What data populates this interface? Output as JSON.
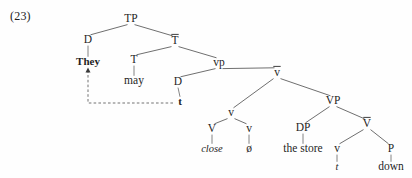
{
  "figure": {
    "example_number": "(23)",
    "caption": "",
    "background_color": "#fefefe",
    "line_color": "#555555",
    "text_color": "#1f1f1f"
  },
  "chart_data": {
    "type": "diagram",
    "subtype": "syntax-tree",
    "title": "(23)",
    "sentence": "They may close down the store",
    "nodes": [
      {
        "id": "TP",
        "label": "TP",
        "x": 131,
        "y": 22,
        "style": "plain"
      },
      {
        "id": "D1",
        "label": "D",
        "x": 88,
        "y": 43,
        "style": "plain"
      },
      {
        "id": "They",
        "label": "They",
        "x": 88,
        "y": 65,
        "style": "bold"
      },
      {
        "id": "Tbar",
        "label": "T",
        "x": 175,
        "y": 44,
        "style": "bar"
      },
      {
        "id": "T",
        "label": "T",
        "x": 134,
        "y": 63,
        "style": "plain"
      },
      {
        "id": "may",
        "label": "may",
        "x": 134,
        "y": 84,
        "style": "plain"
      },
      {
        "id": "vp",
        "label": "vp",
        "x": 219,
        "y": 66,
        "style": "plain"
      },
      {
        "id": "D2",
        "label": "D",
        "x": 178,
        "y": 85,
        "style": "plain"
      },
      {
        "id": "t1",
        "label": "t",
        "x": 180,
        "y": 105,
        "style": "bold-trace"
      },
      {
        "id": "vbar",
        "label": "v",
        "x": 277,
        "y": 76,
        "style": "bar"
      },
      {
        "id": "v1",
        "label": "v",
        "x": 231,
        "y": 116,
        "style": "plain"
      },
      {
        "id": "V1",
        "label": "V",
        "x": 212,
        "y": 132,
        "style": "plain"
      },
      {
        "id": "close",
        "label": "close",
        "x": 212,
        "y": 152,
        "style": "italic"
      },
      {
        "id": "v2",
        "label": "v",
        "x": 249,
        "y": 132,
        "style": "plain"
      },
      {
        "id": "null",
        "label": "ø",
        "x": 249,
        "y": 152,
        "style": "plain"
      },
      {
        "id": "VP",
        "label": "VP",
        "x": 333,
        "y": 104,
        "style": "plain"
      },
      {
        "id": "DP",
        "label": "DP",
        "x": 303,
        "y": 131,
        "style": "plain"
      },
      {
        "id": "thestore",
        "label": "the store",
        "x": 303,
        "y": 152,
        "style": "plain"
      },
      {
        "id": "Vbar",
        "label": "V",
        "x": 367,
        "y": 127,
        "style": "bar"
      },
      {
        "id": "v3",
        "label": "v",
        "x": 337,
        "y": 152,
        "style": "plain"
      },
      {
        "id": "t2",
        "label": "t",
        "x": 337,
        "y": 170,
        "style": "italic-trace"
      },
      {
        "id": "P",
        "label": "P",
        "x": 391,
        "y": 152,
        "style": "plain"
      },
      {
        "id": "down",
        "label": "down",
        "x": 391,
        "y": 170,
        "style": "plain"
      }
    ],
    "edges": [
      [
        "TP",
        "D1"
      ],
      [
        "TP",
        "Tbar"
      ],
      [
        "D1",
        "They"
      ],
      [
        "Tbar",
        "T"
      ],
      [
        "Tbar",
        "vp"
      ],
      [
        "T",
        "may"
      ],
      [
        "vp",
        "D2"
      ],
      [
        "vp",
        "vbar"
      ],
      [
        "D2",
        "t1"
      ],
      [
        "vbar",
        "v1"
      ],
      [
        "vbar",
        "VP"
      ],
      [
        "v1",
        "V1"
      ],
      [
        "v1",
        "v2"
      ],
      [
        "V1",
        "close"
      ],
      [
        "v2",
        "null"
      ],
      [
        "VP",
        "DP"
      ],
      [
        "VP",
        "Vbar"
      ],
      [
        "DP",
        "thestore"
      ],
      [
        "Vbar",
        "v3"
      ],
      [
        "Vbar",
        "P"
      ],
      [
        "v3",
        "t2"
      ],
      [
        "P",
        "down"
      ]
    ],
    "movement_arrows": [
      {
        "from": "t1",
        "to": "They",
        "kind": "dashed-with-arrowhead",
        "direction": "up-left"
      }
    ]
  }
}
